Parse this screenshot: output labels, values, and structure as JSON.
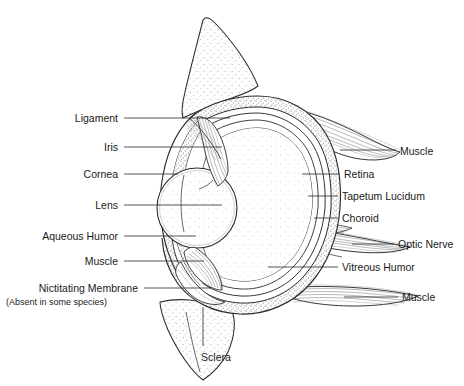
{
  "figure": {
    "background_color": "#ffffff",
    "line_color": "#2b2b2b",
    "text_color": "#1a1a1a",
    "stipple_color": "#9a9a9a"
  },
  "labels_left": [
    {
      "id": "ligament",
      "text": "Ligament",
      "x": 118,
      "y": 118,
      "leader_to_x": 230,
      "leader_to_y": 118
    },
    {
      "id": "iris",
      "text": "Iris",
      "x": 118,
      "y": 147,
      "leader_to_x": 222,
      "leader_to_y": 147
    },
    {
      "id": "cornea",
      "text": "Cornea",
      "x": 118,
      "y": 174,
      "leader_to_x": 178,
      "leader_to_y": 174
    },
    {
      "id": "lens",
      "text": "Lens",
      "x": 118,
      "y": 205,
      "leader_to_x": 222,
      "leader_to_y": 205
    },
    {
      "id": "aqueous",
      "text": "Aqueous Humor",
      "x": 118,
      "y": 236,
      "leader_to_x": 196,
      "leader_to_y": 236
    },
    {
      "id": "muscle-lower-left",
      "text": "Muscle",
      "x": 118,
      "y": 261,
      "leader_to_x": 204,
      "leader_to_y": 261
    },
    {
      "id": "nictitating",
      "text": "Nictitating Membrane",
      "x": 138,
      "y": 288,
      "leader_to_x": 210,
      "leader_to_y": 288
    }
  ],
  "labels_left_sub": [
    {
      "id": "nictitating-note",
      "text": "(Absent in some species)",
      "x": 6,
      "y": 301
    }
  ],
  "labels_right": [
    {
      "id": "muscle-upper-right",
      "text": "Muscle",
      "x": 402,
      "y": 155,
      "leader_from_x": 340,
      "leader_from_y": 148
    },
    {
      "id": "retina",
      "text": "Retina",
      "x": 346,
      "y": 174,
      "leader_from_x": 302,
      "leader_from_y": 174
    },
    {
      "id": "tapetum",
      "text": "Tapetum Lucidum",
      "x": 344,
      "y": 196,
      "leader_from_x": 308,
      "leader_from_y": 196
    },
    {
      "id": "choroid",
      "text": "Choroid",
      "x": 344,
      "y": 218,
      "leader_from_x": 312,
      "leader_from_y": 218
    },
    {
      "id": "optic-nerve",
      "text": "Optic Nerve",
      "x": 400,
      "y": 248,
      "leader_from_x": 352,
      "leader_from_y": 243
    },
    {
      "id": "vitreous",
      "text": "Vitreous Humor",
      "x": 344,
      "y": 271,
      "leader_from_x": 268,
      "leader_from_y": 267
    },
    {
      "id": "muscle-lower-right",
      "text": "Muscle",
      "x": 404,
      "y": 300,
      "leader_from_x": 344,
      "leader_from_y": 297
    }
  ],
  "labels_bottom": [
    {
      "id": "sclera",
      "text": "Sclera",
      "x": 198,
      "y": 357,
      "leader_from_x": 203,
      "leader_from_y": 310
    }
  ]
}
